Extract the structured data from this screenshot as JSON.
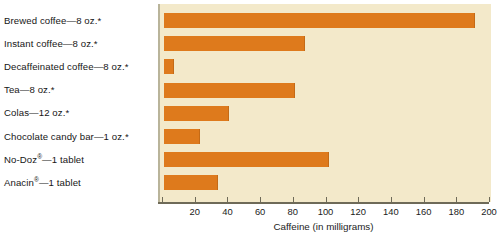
{
  "chart_data": {
    "type": "bar",
    "orientation": "horizontal",
    "title": "",
    "xlabel": "Caffeine (in milligrams)",
    "ylabel": "",
    "xlim": [
      0,
      200
    ],
    "xticks": [
      0,
      20,
      40,
      60,
      80,
      100,
      120,
      140,
      160,
      180,
      200
    ],
    "xtick_labels": [
      "",
      "20",
      "40",
      "60",
      "80",
      "100",
      "120",
      "140",
      "160",
      "180",
      "200"
    ],
    "grid": false,
    "legend": null,
    "categories": [
      "Brewed coffee—8 oz.*",
      "Instant coffee—8 oz.*",
      "Decaffeinated coffee—8 oz.*",
      "Tea—8 oz.*",
      "Colas—12 oz.*",
      "Chocolate candy bar—1 oz.*",
      "No-Doz®—1 tablet",
      "Anacin®—1 tablet"
    ],
    "values": [
      190,
      86,
      6,
      80,
      40,
      22,
      101,
      33
    ],
    "bar_color": "#de7a1c",
    "plot_background": "#f3e9ca",
    "figure_background": "#ffffff",
    "axis_color": "#6e6a58"
  },
  "labels": {
    "items": [
      {
        "text": "Brewed coffee—8 oz.*",
        "reg": false
      },
      {
        "text": "Instant coffee—8 oz.*",
        "reg": false
      },
      {
        "text": "Decaffeinated coffee—8 oz.*",
        "reg": false
      },
      {
        "text": "Tea—8 oz.*",
        "reg": false
      },
      {
        "text": "Colas—12 oz.*",
        "reg": false
      },
      {
        "text": "Chocolate candy bar—1 oz.*",
        "reg": false
      },
      {
        "text": "No-Doz",
        "reg": true,
        "suffix": "—1 tablet"
      },
      {
        "text": "Anacin",
        "reg": true,
        "suffix": "—1 tablet"
      }
    ],
    "registered_mark": "®"
  },
  "axis": {
    "title": "Caffeine (in milligrams)",
    "ticks": [
      "",
      "20",
      "40",
      "60",
      "80",
      "100",
      "120",
      "140",
      "160",
      "180",
      "200"
    ]
  }
}
